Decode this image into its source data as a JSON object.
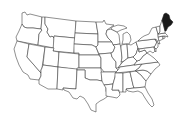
{
  "map": {
    "title": "",
    "region": "Contiguous United States",
    "colors": {
      "background": "#ffffff",
      "state_fill": "#ffffff",
      "state_stroke": "#333333",
      "highlight_fill": "#1a1a1a"
    },
    "highlighted_states": [
      "Maine"
    ],
    "states": [
      {
        "id": "WA",
        "name": "Washington"
      },
      {
        "id": "OR",
        "name": "Oregon"
      },
      {
        "id": "CA",
        "name": "California"
      },
      {
        "id": "ID",
        "name": "Idaho"
      },
      {
        "id": "NV",
        "name": "Nevada"
      },
      {
        "id": "MT",
        "name": "Montana"
      },
      {
        "id": "WY",
        "name": "Wyoming"
      },
      {
        "id": "UT",
        "name": "Utah"
      },
      {
        "id": "AZ",
        "name": "Arizona"
      },
      {
        "id": "CO",
        "name": "Colorado"
      },
      {
        "id": "NM",
        "name": "New Mexico"
      },
      {
        "id": "ND",
        "name": "North Dakota"
      },
      {
        "id": "SD",
        "name": "South Dakota"
      },
      {
        "id": "NE",
        "name": "Nebraska"
      },
      {
        "id": "KS",
        "name": "Kansas"
      },
      {
        "id": "OK",
        "name": "Oklahoma"
      },
      {
        "id": "TX",
        "name": "Texas"
      },
      {
        "id": "MN",
        "name": "Minnesota"
      },
      {
        "id": "IA",
        "name": "Iowa"
      },
      {
        "id": "MO",
        "name": "Missouri"
      },
      {
        "id": "AR",
        "name": "Arkansas"
      },
      {
        "id": "LA",
        "name": "Louisiana"
      },
      {
        "id": "WI",
        "name": "Wisconsin"
      },
      {
        "id": "IL",
        "name": "Illinois"
      },
      {
        "id": "MI",
        "name": "Michigan"
      },
      {
        "id": "IN",
        "name": "Indiana"
      },
      {
        "id": "OH",
        "name": "Ohio"
      },
      {
        "id": "KY",
        "name": "Kentucky"
      },
      {
        "id": "TN",
        "name": "Tennessee"
      },
      {
        "id": "MS",
        "name": "Mississippi"
      },
      {
        "id": "AL",
        "name": "Alabama"
      },
      {
        "id": "GA",
        "name": "Georgia"
      },
      {
        "id": "FL",
        "name": "Florida"
      },
      {
        "id": "SC",
        "name": "South Carolina"
      },
      {
        "id": "NC",
        "name": "North Carolina"
      },
      {
        "id": "VA",
        "name": "Virginia"
      },
      {
        "id": "WV",
        "name": "West Virginia"
      },
      {
        "id": "PA",
        "name": "Pennsylvania"
      },
      {
        "id": "NY",
        "name": "New York"
      },
      {
        "id": "VT",
        "name": "Vermont"
      },
      {
        "id": "NH",
        "name": "New Hampshire"
      },
      {
        "id": "ME",
        "name": "Maine"
      },
      {
        "id": "MA",
        "name": "Massachusetts"
      },
      {
        "id": "CT",
        "name": "Connecticut"
      },
      {
        "id": "RI",
        "name": "Rhode Island"
      },
      {
        "id": "NJ",
        "name": "New Jersey"
      },
      {
        "id": "DE",
        "name": "Delaware"
      },
      {
        "id": "MD",
        "name": "Maryland"
      }
    ]
  }
}
